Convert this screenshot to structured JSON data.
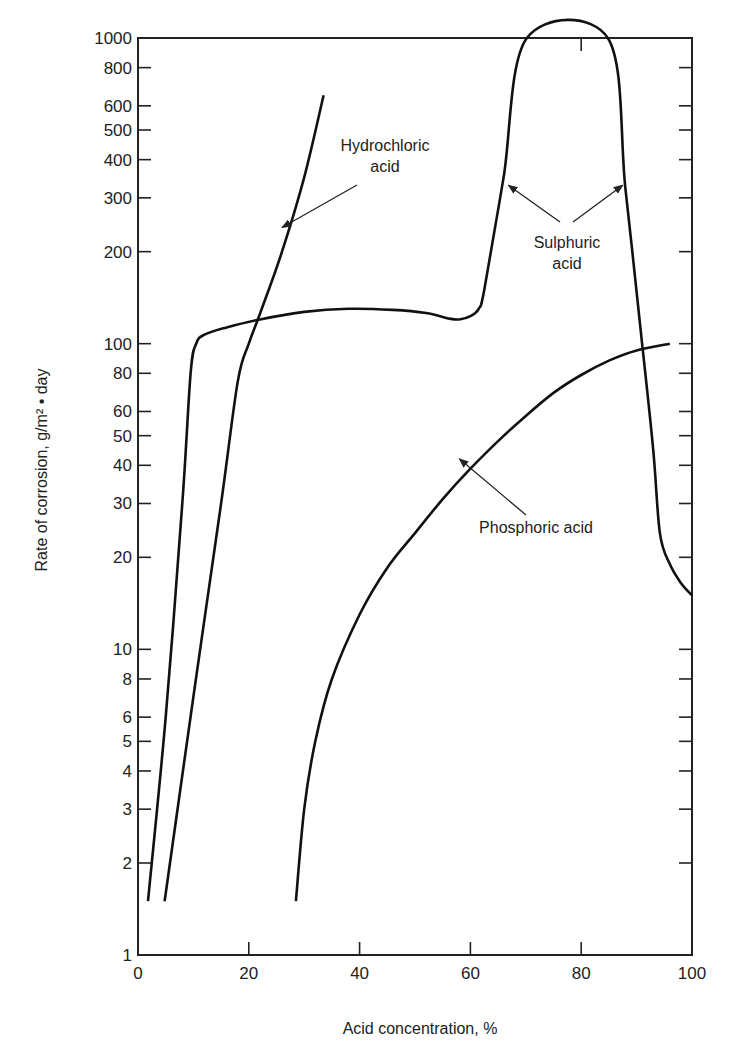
{
  "chart_data": {
    "type": "line",
    "title": "",
    "xlabel": "Acid concentration, %",
    "ylabel": "Rate of corrosion, g/m² • day",
    "xlim": [
      0,
      100
    ],
    "ylim": [
      1,
      1000
    ],
    "yscale": "log",
    "grid": false,
    "xticks": [
      0,
      20,
      40,
      60,
      80,
      100
    ],
    "xtick_labels": [
      "0",
      "20",
      "40",
      "60",
      "80",
      "100"
    ],
    "yticks": [
      1,
      2,
      3,
      4,
      5,
      6,
      8,
      10,
      20,
      30,
      40,
      50,
      60,
      80,
      100,
      200,
      300,
      400,
      500,
      600,
      800,
      1000
    ],
    "ytick_labels": [
      "1",
      "2",
      "3",
      "4",
      "5",
      "6",
      "8",
      "10",
      "20",
      "30",
      "40",
      "50",
      "60",
      "80",
      "100",
      "200",
      "300",
      "400",
      "500",
      "600",
      "800",
      "1000"
    ],
    "series": [
      {
        "name": "Sulphuric acid",
        "x": [
          1.8,
          5,
          8,
          9.5,
          10.5,
          12,
          16,
          22,
          30,
          38,
          46,
          52,
          56,
          58,
          60,
          61.5,
          62.5,
          66,
          70.2,
          84.8,
          88,
          91,
          93,
          94.2,
          96,
          98,
          100
        ],
        "y": [
          1.5,
          6,
          30,
          80,
          100,
          107,
          113,
          120,
          127,
          130,
          129,
          126,
          121,
          120,
          123,
          130,
          150,
          350,
          1000,
          1000,
          320,
          100,
          45,
          24,
          19,
          16.5,
          15
        ]
      },
      {
        "name": "Hydrochloric acid",
        "x": [
          4.8,
          10,
          15,
          18,
          20,
          22,
          26,
          30,
          33.5
        ],
        "y": [
          1.5,
          7,
          30,
          75,
          100,
          125,
          200,
          350,
          650
        ]
      },
      {
        "name": "Phosphoric acid",
        "x": [
          28.5,
          30,
          32,
          35,
          40,
          45,
          50,
          55,
          60,
          65,
          70,
          75,
          80,
          85,
          90,
          96
        ],
        "y": [
          1.5,
          3,
          5,
          8,
          13,
          18.5,
          24,
          31,
          39,
          48,
          58,
          69,
          79,
          88,
          95,
          100
        ]
      }
    ],
    "annotations": [
      {
        "text_lines": [
          "Hydrochloric",
          "acid"
        ],
        "target": "Hydrochloric acid",
        "point": [
          26,
          240
        ]
      },
      {
        "text_lines": [
          "Sulphuric",
          "acid"
        ],
        "target": "Sulphuric acid",
        "points": [
          [
            66.5,
            330
          ],
          [
            87.5,
            330
          ]
        ]
      },
      {
        "text_lines": [
          "Phosphoric acid"
        ],
        "target": "Phosphoric acid",
        "point": [
          58,
          42
        ]
      }
    ],
    "extra_top_tick": 80
  }
}
